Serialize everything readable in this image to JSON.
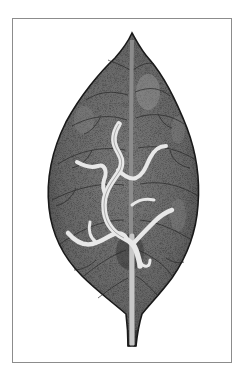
{
  "illustration": {
    "subject": "leaf with serpentine mine trails",
    "colors": {
      "background": "#ffffff",
      "frame_border": "#8c8c8c",
      "leaf_fill": "#6e6e6e",
      "leaf_fill_dark": "#4d4d4d",
      "leaf_outline": "#1a1a1a",
      "vein": "#2a2a2a",
      "midrib": "#a8a8a8",
      "mine_trail": "#e6e6e6",
      "highlight": "#8f8f8f"
    }
  }
}
